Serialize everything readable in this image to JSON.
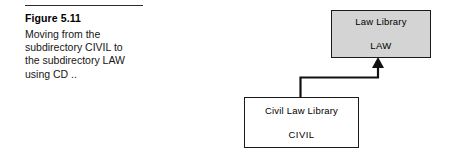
{
  "figure": {
    "rule": "horizontal-rule",
    "title": "Figure 5.11",
    "caption_lines": [
      "Moving from the",
      "subdirectory CIVIL to",
      "the subdirectory LAW",
      "using CD .."
    ]
  },
  "diagram": {
    "type": "directory-tree-navigation",
    "nodes": [
      {
        "id": "law",
        "title": "Law Library",
        "name": "LAW",
        "fill": "#d4d4d4",
        "border": "#1a1a1a"
      },
      {
        "id": "civil",
        "title": "Civil Law Library",
        "name": "CIVIL",
        "fill": "#ffffff",
        "border": "#1a1a1a"
      }
    ],
    "connector": {
      "from": "civil",
      "to": "law",
      "arrowhead": "up",
      "color": "#111111"
    }
  }
}
